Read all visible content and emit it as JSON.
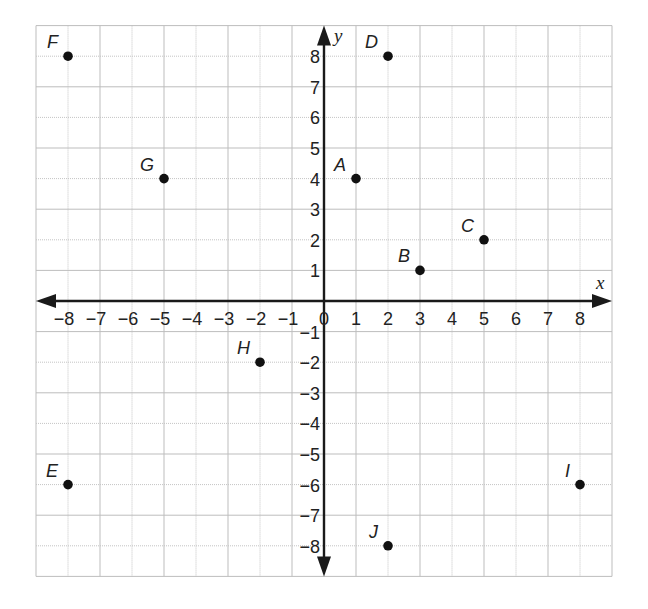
{
  "chart_data": {
    "type": "scatter",
    "title": "",
    "xlabel": "x",
    "ylabel": "y",
    "xlim": [
      -9,
      9
    ],
    "ylim": [
      -9,
      9
    ],
    "grid": true,
    "legend": null,
    "x_ticks": [
      -8,
      -7,
      -6,
      -5,
      -4,
      -3,
      -2,
      -1,
      0,
      1,
      2,
      3,
      4,
      5,
      6,
      7,
      8
    ],
    "y_ticks": [
      -8,
      -7,
      -6,
      -5,
      -4,
      -3,
      -2,
      -1,
      1,
      2,
      3,
      4,
      5,
      6,
      7,
      8
    ],
    "x_tick_labels": [
      "−8",
      "−7",
      "−6",
      "−5",
      "−4",
      "−3",
      "−2",
      "−1",
      "0",
      "1",
      "2",
      "3",
      "4",
      "5",
      "6",
      "7",
      "8"
    ],
    "y_tick_labels": [
      "−8",
      "−7",
      "−6",
      "−5",
      "−4",
      "−3",
      "−2",
      "−1",
      "1",
      "2",
      "3",
      "4",
      "5",
      "6",
      "7",
      "8"
    ],
    "points": [
      {
        "label": "A",
        "x": 1,
        "y": 4
      },
      {
        "label": "B",
        "x": 3,
        "y": 1
      },
      {
        "label": "C",
        "x": 5,
        "y": 2
      },
      {
        "label": "D",
        "x": 2,
        "y": 8
      },
      {
        "label": "E",
        "x": -8,
        "y": -6
      },
      {
        "label": "F",
        "x": -8,
        "y": 8
      },
      {
        "label": "G",
        "x": -5,
        "y": 4
      },
      {
        "label": "H",
        "x": -2,
        "y": -2
      },
      {
        "label": "I",
        "x": 8,
        "y": -6
      },
      {
        "label": "J",
        "x": 2,
        "y": -8
      }
    ]
  },
  "layout": {
    "origin_px": [
      324,
      301
    ],
    "unit_px_x": 32,
    "unit_px_y": 30.6,
    "colors": {
      "grid": "#bdbdbd",
      "axis": "#1a1a1a",
      "point": "#111111",
      "background": "#ffffff"
    }
  }
}
